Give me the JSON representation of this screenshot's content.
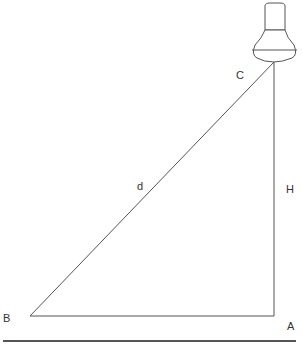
{
  "diagram": {
    "labels": {
      "A": "A",
      "B": "B",
      "C": "C",
      "d": "d",
      "H": "H"
    },
    "colors": {
      "line": "#555555",
      "ground": "#555555",
      "text": "#333333"
    },
    "objects": [
      "lamp-bulb",
      "triangle-ABC",
      "ground-line"
    ]
  }
}
